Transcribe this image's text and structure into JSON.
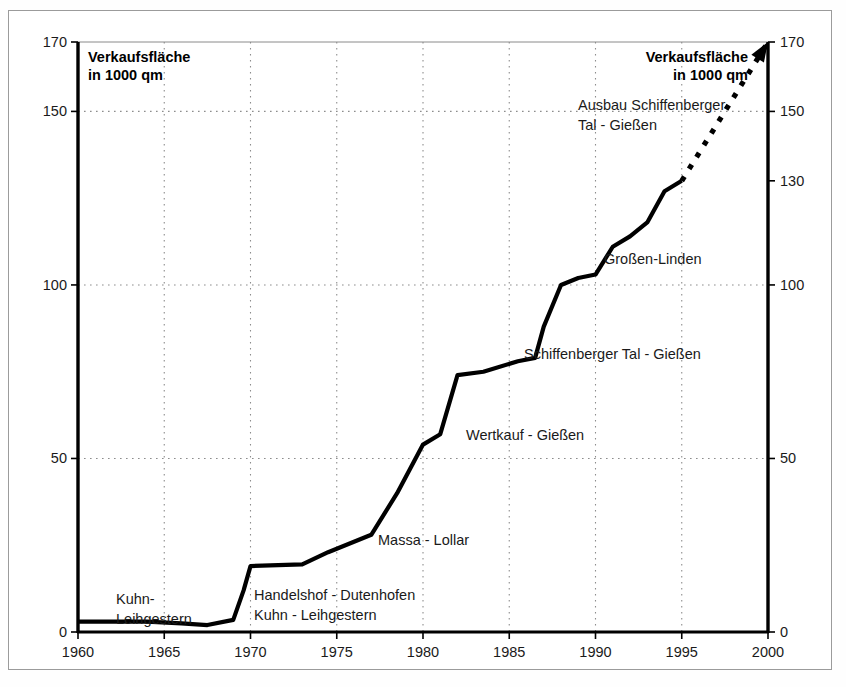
{
  "frame": {
    "border_color": "#9b9b9b",
    "background": "#ffffff"
  },
  "headers": {
    "left": {
      "line1": "Verkaufsfläche",
      "line2": "in 1000 qm"
    },
    "right": {
      "line1": "Verkaufsfläche",
      "line2": "in 1000 qm"
    }
  },
  "axes": {
    "left_ticks": [
      "170",
      "150",
      "100",
      "50",
      "0"
    ],
    "right_ticks": [
      "170",
      "150",
      "130",
      "100",
      "50",
      "0"
    ],
    "x_ticks": [
      "1960",
      "1965",
      "1970",
      "1975",
      "1980",
      "1985",
      "1990",
      "1995",
      "2000"
    ]
  },
  "annotations": [
    {
      "id": "kuhn-leihgestern-1",
      "line1": "Kuhn-",
      "line2": "Leihgestern"
    },
    {
      "id": "handelshof-dutenhofen",
      "line1": "Handelshof - Dutenhofen",
      "line2": "Kuhn - Leihgestern"
    },
    {
      "id": "massa-lollar",
      "line1": "Massa - Lollar",
      "line2": ""
    },
    {
      "id": "wertkauf-giessen",
      "line1": "Wertkauf - Gießen",
      "line2": ""
    },
    {
      "id": "schiffenberger-tal-giessen",
      "line1": "Schiffenberger Tal - Gießen",
      "line2": ""
    },
    {
      "id": "grossen-linden",
      "line1": "Großen-Linden",
      "line2": ""
    },
    {
      "id": "ausbau-schiffenberger",
      "line1": "Ausbau Schiffenberger",
      "line2": "Tal - Gießen"
    }
  ],
  "colors": {
    "series": "#000000",
    "grid": "#8d8d8d",
    "axis": "#000000",
    "text": "#1a1a1a"
  },
  "chart_data": {
    "type": "line",
    "title": "",
    "subtitle": "",
    "xlabel": "",
    "ylabel": "Verkaufsfläche in 1000 qm",
    "xlim": [
      1960,
      2000
    ],
    "ylim": [
      0,
      170
    ],
    "grid": true,
    "legend": "none",
    "y_gridlines": [
      50,
      100,
      150,
      170
    ],
    "x_gridlines": [
      1965,
      1970,
      1975,
      1980,
      1985,
      1990,
      1995
    ],
    "series": [
      {
        "name": "Verkaufsfläche (Ist)",
        "style": "solid",
        "x": [
          1960,
          1964,
          1966,
          1967.5,
          1969,
          1969.6,
          1970,
          1973,
          1974.5,
          1977,
          1978.5,
          1980,
          1981,
          1982,
          1983.5,
          1985.5,
          1986.5,
          1987,
          1988,
          1989,
          1990,
          1991,
          1992,
          1993,
          1994,
          1995
        ],
        "y": [
          3,
          3,
          2.5,
          2,
          3.5,
          12,
          19,
          19.5,
          23,
          28,
          40,
          54,
          57,
          74,
          75,
          78,
          79,
          88,
          100,
          102,
          103,
          111,
          114,
          118,
          127,
          130
        ]
      },
      {
        "name": "Verkaufsfläche (Prognose)",
        "style": "dashed",
        "arrow": true,
        "x": [
          1995,
          2000
        ],
        "y": [
          130,
          170
        ]
      }
    ],
    "annotations": [
      {
        "text": "Kuhn- / Leihgestern",
        "x": 1963.5,
        "y": 14
      },
      {
        "text": "Handelshof - Dutenhofen / Kuhn - Leihgestern",
        "x": 1970.2,
        "y": 14
      },
      {
        "text": "Massa - Lollar",
        "x": 1977.5,
        "y": 28
      },
      {
        "text": "Wertkauf - Gießen",
        "x": 1981.5,
        "y": 57
      },
      {
        "text": "Schiffenberger Tal - Gießen",
        "x": 1985.8,
        "y": 79
      },
      {
        "text": "Großen-Linden",
        "x": 1989.3,
        "y": 103
      },
      {
        "text": "Ausbau Schiffenberger / Tal - Gießen",
        "x": 1991.5,
        "y": 149
      }
    ]
  }
}
